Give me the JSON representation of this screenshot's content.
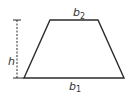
{
  "diagram": {
    "shape": "trapezoid",
    "stroke_color": "#2b2b2b",
    "background": "#ffffff",
    "vertices": {
      "top_left": [
        50,
        20
      ],
      "top_right": [
        98,
        20
      ],
      "bottom_right": [
        124,
        78
      ],
      "bottom_left": [
        24,
        78
      ]
    },
    "labels": {
      "top_base": {
        "main": "b",
        "sub": "2"
      },
      "bottom_base": {
        "main": "b",
        "sub": "1"
      },
      "height": {
        "main": "h"
      }
    },
    "height_marker": {
      "style": "dashed",
      "x": 17,
      "y_top": 20,
      "y_bottom": 78
    }
  }
}
